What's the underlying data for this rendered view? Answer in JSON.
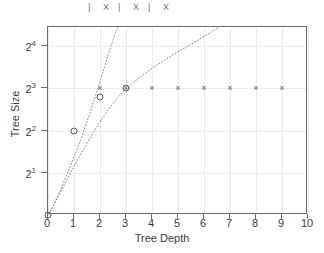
{
  "legend_strip": {
    "items": [
      "|",
      "X",
      "|",
      "X",
      "|",
      "X"
    ]
  },
  "chart_data": {
    "type": "scatter",
    "title": "",
    "xlabel": "Tree Depth",
    "ylabel": "Tree Size",
    "xlim": [
      0,
      10
    ],
    "ylim_log2": [
      0,
      4.45
    ],
    "yscale": "log2",
    "grid": true,
    "legend_position": "top-clipped",
    "x_ticks": [
      "0",
      "1",
      "2",
      "3",
      "4",
      "5",
      "6",
      "7",
      "8",
      "9",
      "10"
    ],
    "x_tick_values": [
      0,
      1,
      2,
      3,
      4,
      5,
      6,
      7,
      8,
      9,
      10
    ],
    "y_ticks": [
      "2",
      "2",
      "2",
      "2"
    ],
    "y_tick_exponents": [
      "1",
      "2",
      "3",
      "4"
    ],
    "y_tick_values": [
      2,
      4,
      8,
      16
    ],
    "series": [
      {
        "name": "circle-series",
        "marker": "circle",
        "color": "#5a5a5a",
        "x": [
          0,
          1,
          2,
          3
        ],
        "y": [
          1,
          4,
          6.9,
          8
        ]
      },
      {
        "name": "cross-series",
        "marker": "x",
        "color": "#5a5a5a",
        "x": [
          2,
          3,
          4,
          5,
          6,
          7,
          8,
          9
        ],
        "y": [
          8,
          8,
          8,
          8,
          8,
          8,
          8,
          8
        ]
      }
    ],
    "curves": [
      {
        "name": "exponential-curve",
        "style": "dotted",
        "color": "#8a8a8a",
        "description": "steep exponential rising off top of plot near depth 2.2"
      },
      {
        "name": "saturating-curve",
        "style": "dotted",
        "color": "#8a8a8a",
        "description": "concave curve rising from origin, reaching top edge near depth 5.8"
      }
    ]
  },
  "colors": {
    "frame": "#6b6b6b",
    "grid": "#e9e9ef",
    "marker": "#5a5a5a",
    "curve": "#8a8a8a",
    "text": "#3c3c3c"
  }
}
